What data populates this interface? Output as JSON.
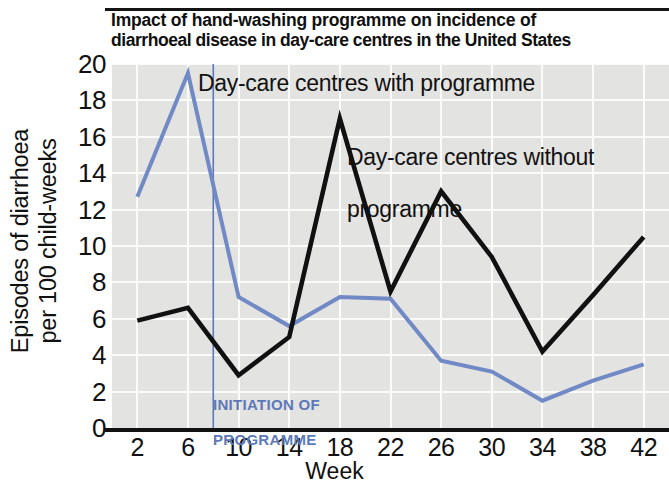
{
  "chart_data": {
    "type": "line",
    "title": "Impact of hand-washing programme on incidence of diarrhoeal disease in day-care centres in the United States",
    "title_line1": "Impact of hand-washing programme on incidence of",
    "title_line2": "diarrhoeal disease in day-care centres in the United States",
    "xlabel": "Week",
    "ylabel": "Episodes of diarrhoea per 100 child-weeks",
    "ylabel_line1": "Episodes of diarrhoea",
    "ylabel_line2": "per 100 child-weeks",
    "x": [
      2,
      6,
      10,
      14,
      18,
      22,
      26,
      30,
      34,
      38,
      42
    ],
    "xticks": [
      "2",
      "6",
      "10",
      "14",
      "18",
      "22",
      "26",
      "30",
      "34",
      "38",
      "42"
    ],
    "yticks": [
      "20",
      "18",
      "16",
      "14",
      "12",
      "10",
      "8",
      "6",
      "4",
      "2",
      "0"
    ],
    "xlim": [
      0,
      44
    ],
    "ylim": [
      0,
      20
    ],
    "grid": true,
    "legend_position": "inline-annotation",
    "series": [
      {
        "name": "Day-care centres with programme",
        "color": "#7189c4",
        "values": [
          12.7,
          19.5,
          7.2,
          5.6,
          7.2,
          7.1,
          3.7,
          3.1,
          1.5,
          2.6,
          3.5
        ]
      },
      {
        "name": "Day-care centres without programme",
        "color": "#111111",
        "values": [
          5.9,
          6.6,
          2.9,
          5.0,
          17.0,
          7.5,
          13.0,
          9.4,
          4.2,
          7.3,
          10.5
        ]
      }
    ],
    "annotations": [
      {
        "name": "initiation-of-programme",
        "text": "INITIATION OF\nPROGRAMME",
        "text_line1": "INITIATION OF",
        "text_line2": "PROGRAMME",
        "x_week": 8,
        "color": "#5d79b8",
        "marker": "vertical-line"
      },
      {
        "name": "series-label-with-programme",
        "text": "Day-care centres with programme"
      },
      {
        "name": "series-label-without-programme",
        "text": "Day-care centres without\nprogramme",
        "text_line1": "Day-care centres without",
        "text_line2": "programme"
      }
    ]
  },
  "colors": {
    "background": "#ffffff",
    "plot_background": "#e3e3e1",
    "gridline": "#fbfbfa",
    "axis": "#121212",
    "series_blue": "#7189c4",
    "series_black": "#111111",
    "annotation_blue": "#5d79b8"
  }
}
